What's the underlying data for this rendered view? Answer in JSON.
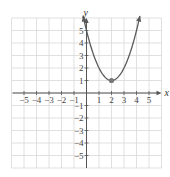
{
  "chart_data": {
    "type": "line",
    "title": "",
    "xlabel": "x",
    "ylabel": "y",
    "xlim": [
      -6,
      6
    ],
    "ylim": [
      -6,
      6
    ],
    "grid": true,
    "x_ticks": [
      -5,
      -4,
      -3,
      -2,
      -1,
      1,
      2,
      3,
      4,
      5
    ],
    "y_ticks": [
      -5,
      -4,
      -3,
      -2,
      -1,
      1,
      2,
      3,
      4,
      5
    ],
    "x_tick_labels": [
      "−5",
      "−4",
      "−3",
      "−2",
      "−1",
      "1",
      "2",
      "3",
      "4",
      "5"
    ],
    "y_tick_labels": [
      "−5",
      "−4",
      "−3",
      "−2",
      "−1",
      "1",
      "2",
      "3",
      "4",
      "5"
    ],
    "series": [
      {
        "name": "parabola",
        "equation": "y = (x - 2)^2 + 1",
        "x": [
          -0.35,
          0,
          0.5,
          1,
          1.5,
          2,
          2.5,
          3,
          3.5,
          4,
          4.35
        ],
        "y": [
          6.52,
          5,
          3.25,
          2,
          1.25,
          1,
          1.25,
          2,
          3.25,
          5,
          6.52
        ],
        "arrows_both_ends": true,
        "color": "#5a5a5a"
      }
    ],
    "annotations": [
      {
        "type": "point",
        "label": "vertex",
        "x": 2,
        "y": 1
      }
    ]
  },
  "colors": {
    "grid": "#d8d8d8",
    "axis": "#555555",
    "curve": "#5a5a5a",
    "vertex": "#777777"
  }
}
